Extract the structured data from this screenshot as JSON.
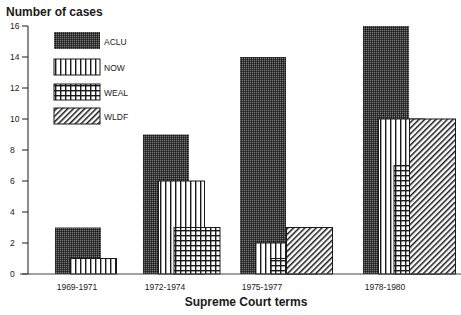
{
  "chart_data": {
    "type": "bar",
    "title": "",
    "ylabel": "Number of cases",
    "xlabel": "Supreme Court terms",
    "ylim": [
      0,
      16
    ],
    "yticks": [
      0,
      2,
      4,
      6,
      8,
      10,
      12,
      14,
      16
    ],
    "categories": [
      "1969-1971",
      "1972-1974",
      "1975-1977",
      "1978-1980"
    ],
    "series": [
      {
        "name": "ACLU",
        "pattern": "dense-dots",
        "values": [
          3,
          9,
          14,
          16
        ]
      },
      {
        "name": "NOW",
        "pattern": "vertical-lines",
        "values": [
          1,
          6,
          2,
          10
        ]
      },
      {
        "name": "WEAL",
        "pattern": "grid",
        "values": [
          0,
          3,
          1,
          7
        ]
      },
      {
        "name": "WLDF",
        "pattern": "diagonal-lines",
        "values": [
          0,
          0,
          3,
          10
        ]
      }
    ],
    "legend": {
      "placement": "top-left",
      "entries": [
        "ACLU",
        "NOW",
        "WEAL",
        "WLDF"
      ]
    },
    "grid": false,
    "bar_style": "overlapping-staggered"
  },
  "colors": {
    "ink": "#1a1a1a",
    "background": "#ffffff"
  }
}
